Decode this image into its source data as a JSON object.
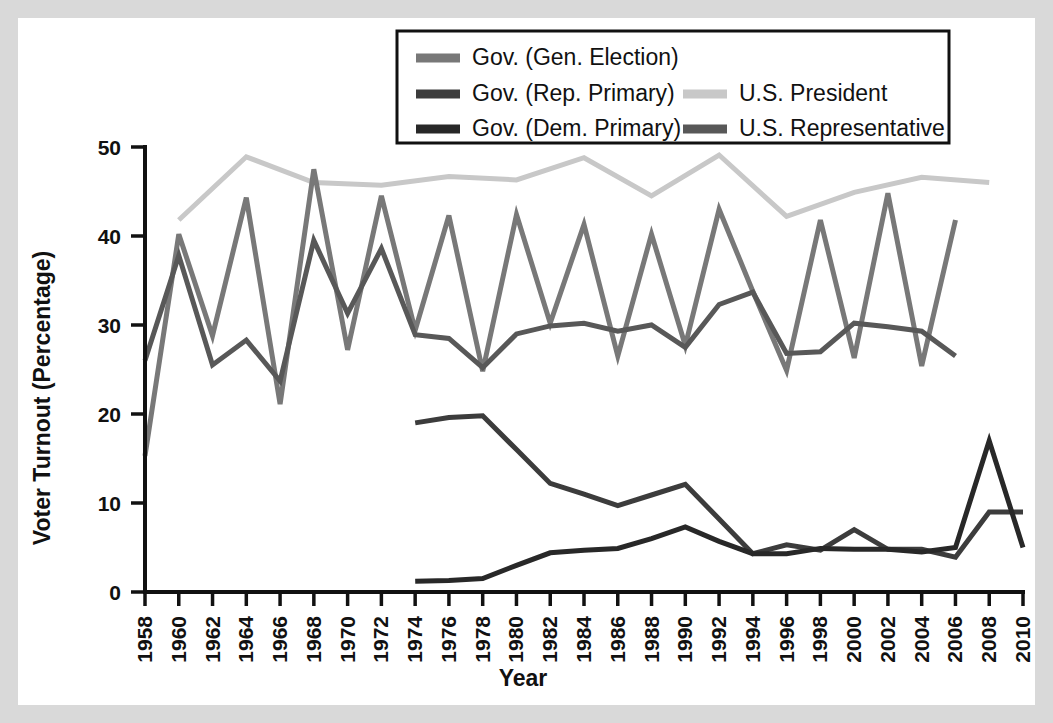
{
  "chart_data": {
    "type": "line",
    "title": "",
    "xlabel": "Year",
    "ylabel": "Voter Turnout (Percentage)",
    "xlim": [
      1958,
      2010
    ],
    "ylim": [
      0,
      50
    ],
    "yticks": [
      0,
      10,
      20,
      30,
      40,
      50
    ],
    "grid": false,
    "legend_position": "top-center",
    "categories": [
      1958,
      1960,
      1962,
      1964,
      1966,
      1968,
      1970,
      1972,
      1974,
      1976,
      1978,
      1980,
      1982,
      1984,
      1986,
      1988,
      1990,
      1992,
      1994,
      1996,
      1998,
      2000,
      2002,
      2004,
      2006,
      2008,
      2010
    ],
    "xtick_labels": [
      "1958",
      "1960",
      "1962",
      "1964",
      "1966",
      "1968",
      "1970",
      "1972",
      "1974",
      "1976",
      "1978",
      "1980",
      "1982",
      "1984",
      "1986",
      "1988",
      "1990",
      "1992",
      "1994",
      "1996",
      "1998",
      "2000",
      "2002",
      "2004",
      "2006",
      "2008",
      "2010"
    ],
    "ytick_labels": [
      "0",
      "10",
      "20",
      "30",
      "40",
      "50"
    ],
    "series": [
      {
        "name": "Gov. (Gen. Election)",
        "color": "#787878",
        "width": 5,
        "x": [
          1958,
          1960,
          1962,
          1964,
          1966,
          1968,
          1970,
          1972,
          1974,
          1976,
          1978,
          1980,
          1982,
          1984,
          1986,
          1988,
          1990,
          1992,
          1994,
          1996,
          1998,
          2000,
          2002,
          2004,
          2006,
          2008,
          2010
        ],
        "values": [
          15.3,
          40.2,
          28.8,
          44.3,
          21.1,
          47.5,
          27.2,
          44.5,
          29.4,
          42.3,
          24.8,
          42.4,
          30.2,
          41.3,
          26.5,
          40.2,
          27.7,
          43.0,
          33.8,
          24.9,
          41.8,
          26.3,
          44.8,
          25.4,
          41.8,
          null,
          null
        ]
      },
      {
        "name": "Gov. (Rep. Primary)",
        "color": "#3c3c3c",
        "width": 5,
        "x": [
          1974,
          1976,
          1978,
          1980,
          1982,
          1984,
          1986,
          1988,
          1990,
          1992,
          1994,
          1996,
          1998,
          2000,
          2002,
          2004,
          2006,
          2008,
          2010
        ],
        "values": [
          19.0,
          19.6,
          19.8,
          16.0,
          12.2,
          11.0,
          9.7,
          10.9,
          12.1,
          8.2,
          4.3,
          5.3,
          4.7,
          7.0,
          4.8,
          4.8,
          3.9,
          9.0,
          9.0
        ]
      },
      {
        "name": "Gov. (Dem. Primary)",
        "color": "#282828",
        "width": 5,
        "x": [
          1974,
          1976,
          1978,
          1980,
          1982,
          1984,
          1986,
          1988,
          1990,
          1992,
          1994,
          1996,
          1998,
          2000,
          2002,
          2004,
          2006,
          2008,
          2010
        ],
        "values": [
          1.2,
          1.3,
          1.5,
          3.0,
          4.4,
          4.7,
          4.9,
          6.0,
          7.3,
          5.7,
          4.3,
          4.3,
          4.9,
          4.8,
          4.8,
          4.5,
          5.0,
          17.0,
          5.0
        ]
      },
      {
        "name": "U.S. President",
        "color": "#c8c8c8",
        "width": 5,
        "x": [
          1960,
          1964,
          1968,
          1972,
          1976,
          1980,
          1984,
          1988,
          1992,
          1996,
          2000,
          2004,
          2008
        ],
        "values": [
          41.8,
          48.9,
          46.0,
          45.7,
          46.7,
          46.3,
          48.8,
          44.5,
          49.1,
          42.2,
          44.9,
          46.6,
          46.0
        ]
      },
      {
        "name": "U.S. Representative",
        "color": "#585858",
        "width": 5,
        "x": [
          1958,
          1960,
          1962,
          1964,
          1966,
          1968,
          1970,
          1972,
          1974,
          1976,
          1978,
          1980,
          1982,
          1984,
          1986,
          1988,
          1990,
          1992,
          1994,
          1996,
          1998,
          2000,
          2002,
          2004,
          2006,
          2008,
          2010
        ],
        "values": [
          26.0,
          37.8,
          25.5,
          28.3,
          23.7,
          39.5,
          31.3,
          38.6,
          28.9,
          28.5,
          25.2,
          29.0,
          29.9,
          30.2,
          29.3,
          30.0,
          27.5,
          32.3,
          33.7,
          26.8,
          27.0,
          30.2,
          29.8,
          29.3,
          26.5,
          null,
          null
        ]
      }
    ],
    "legend": [
      {
        "label": "Gov. (Gen. Election)",
        "color": "#787878",
        "column": 0,
        "row": 0
      },
      {
        "label": "Gov. (Rep. Primary)",
        "color": "#3c3c3c",
        "column": 0,
        "row": 1
      },
      {
        "label": "Gov. (Dem. Primary)",
        "color": "#282828",
        "column": 0,
        "row": 2
      },
      {
        "label": "U.S. President",
        "color": "#c8c8c8",
        "column": 1,
        "row": 1
      },
      {
        "label": "U.S. Representative",
        "color": "#585858",
        "column": 1,
        "row": 2
      }
    ]
  },
  "colors": {
    "page_background": "#ffffff",
    "outer_background": "#d9d9d9",
    "axis": "#111111",
    "text": "#111111"
  }
}
